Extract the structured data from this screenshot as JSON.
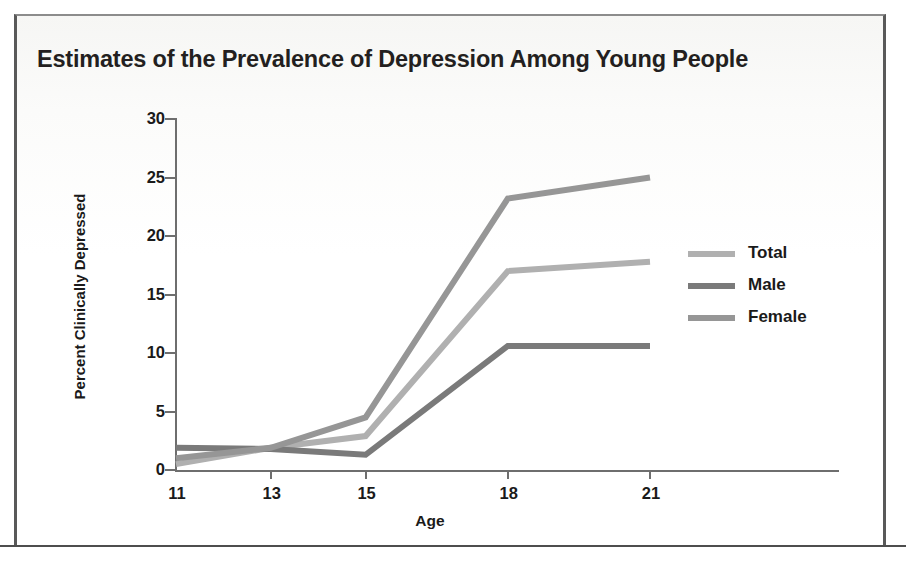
{
  "title": "Estimates of the Prevalence of Depression Among Young People",
  "axis": {
    "x_title": "Age",
    "y_title": "Percent Clinically Depressed"
  },
  "legend": {
    "items": [
      {
        "label": "Total",
        "color": "#b0b0b0"
      },
      {
        "label": "Male",
        "color": "#7a7a7a"
      },
      {
        "label": "Female",
        "color": "#969696"
      }
    ]
  },
  "chart_data": {
    "type": "line",
    "title": "Estimates of the Prevalence of Depression Among Young People",
    "xlabel": "Age",
    "ylabel": "Percent Clinically Depressed",
    "x": [
      11,
      13,
      15,
      18,
      21
    ],
    "xticklabels": [
      "11",
      "13",
      "15",
      "18",
      "21"
    ],
    "yticks": [
      0,
      5,
      10,
      15,
      20,
      25,
      30
    ],
    "yticklabels": [
      "0",
      "5",
      "10",
      "15",
      "20",
      "25",
      "30"
    ],
    "xlim": [
      11,
      23
    ],
    "ylim": [
      0,
      30
    ],
    "grid": false,
    "legend_position": "right",
    "series": [
      {
        "name": "Total",
        "color": "#b0b0b0",
        "values": [
          0.5,
          1.9,
          2.9,
          17.0,
          17.8
        ]
      },
      {
        "name": "Male",
        "color": "#7a7a7a",
        "values": [
          1.9,
          1.8,
          1.3,
          10.6,
          10.6
        ]
      },
      {
        "name": "Female",
        "color": "#969696",
        "values": [
          1.0,
          1.9,
          4.5,
          23.2,
          25.0
        ]
      }
    ]
  }
}
